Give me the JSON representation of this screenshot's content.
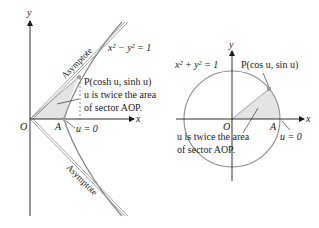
{
  "colors": {
    "axis": "#1a1a1a",
    "curve": "#8c8c8c",
    "sector_fill": "#e4e4e4",
    "point": "#9a9a9a",
    "text": "#1a1a1a"
  },
  "left_panel": {
    "title": "Unit hyperbola",
    "axis_x_label": "x",
    "axis_y_label": "y",
    "equation": "x² − y² = 1",
    "origin_label": "O",
    "vertex_label": "A",
    "u_zero_label": "u = 0",
    "point_label": "P(cosh u, sinh u)",
    "area_note_line1": "u is twice the area",
    "area_note_line2": "of sector AOP.",
    "asymptote_upper_label": "Asymptote",
    "asymptote_lower_label": "Asymptote"
  },
  "right_panel": {
    "title": "Unit circle",
    "axis_x_label": "x",
    "axis_y_label": "y",
    "equation": "x² + y² = 1",
    "origin_label": "O",
    "vertex_label": "A",
    "u_zero_label": "u = 0",
    "point_label": "P(cos u, sin u)",
    "area_note_line1": "u is twice the area",
    "area_note_line2": "of sector AOP."
  }
}
